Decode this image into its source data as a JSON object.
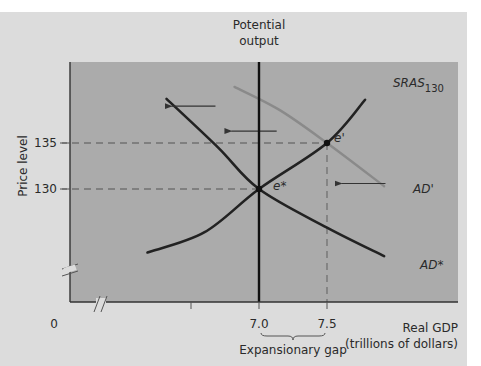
{
  "chart_data": {
    "type": "line",
    "title": "",
    "xlabel": "Real GDP (trillions of dollars)",
    "xlabel_lines": [
      "Real GDP",
      "(trillions of dollars)"
    ],
    "ylabel": "Price level",
    "origin_label": "0",
    "x_ticks": [
      {
        "value": 7.0,
        "label": "7.0"
      },
      {
        "value": 7.5,
        "label": "7.5"
      }
    ],
    "y_ticks": [
      {
        "value": 130,
        "label": "130"
      },
      {
        "value": 135,
        "label": "135"
      }
    ],
    "axis_breaks": {
      "x": true,
      "y": true
    },
    "xlim": [
      5.6,
      8.45
    ],
    "ylim": [
      116,
      142
    ],
    "grid": false,
    "legend": "none",
    "potential_output": {
      "label_lines": [
        "Potential",
        "output"
      ],
      "x": 7.0
    },
    "series": [
      {
        "name": "SRAS130",
        "label_main": "SRAS",
        "label_sub": "130",
        "color": "#222222",
        "points": [
          [
            6.18,
            123.1
          ],
          [
            6.6,
            125.3
          ],
          [
            7.0,
            130
          ],
          [
            7.5,
            135
          ],
          [
            7.78,
            139.7
          ]
        ]
      },
      {
        "name": "AD*",
        "label_main": "AD*",
        "label_sub": "",
        "color": "#222222",
        "points": [
          [
            6.32,
            139.8
          ],
          [
            6.7,
            134.5
          ],
          [
            7.0,
            130
          ],
          [
            7.5,
            125.8
          ],
          [
            7.92,
            122.7
          ]
        ]
      },
      {
        "name": "AD'",
        "label_main": "AD'",
        "label_sub": "",
        "color": "#8a8a8a",
        "points": [
          [
            6.82,
            141.1
          ],
          [
            7.15,
            138.6
          ],
          [
            7.5,
            135
          ],
          [
            7.92,
            130.3
          ]
        ]
      }
    ],
    "equilibria": [
      {
        "name": "e*",
        "label": "e*",
        "x": 7.0,
        "y": 130
      },
      {
        "name": "e'",
        "label": "e'",
        "x": 7.5,
        "y": 135
      }
    ],
    "shift_arrows": [
      {
        "from": [
          6.68,
          139.0
        ],
        "to": [
          6.35,
          139.0
        ]
      },
      {
        "from": [
          7.13,
          136.3
        ],
        "to": [
          6.79,
          136.3
        ]
      },
      {
        "from": [
          7.93,
          130.6
        ],
        "to": [
          7.6,
          130.6
        ]
      }
    ],
    "annotations": [
      {
        "text": "Expansionary gap",
        "x_from": 7.0,
        "x_to": 7.5
      }
    ]
  }
}
